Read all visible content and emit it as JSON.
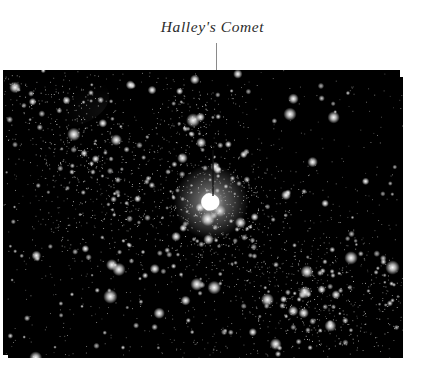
{
  "page": {
    "background_color": "#ffffff",
    "width": 421,
    "height": 375
  },
  "caption": {
    "text": "Halley's Comet",
    "color": "#2b2b2b",
    "style": "italic-serif"
  },
  "leader_line": {
    "color": "#8a8a8a",
    "x": 216,
    "from_y": 43,
    "to_y": 72
  },
  "photo": {
    "name": "halleys-comet-starfield-photograph",
    "x": 3,
    "y": 70,
    "width": 400,
    "height": 288,
    "background_color": "#000000",
    "star_color": "#ffffff",
    "description": "Dense black-and-white astronomical photograph of a star field with Halley's Comet as a bright fan-shaped smudge near the centre",
    "pointer_in_image": {
      "color": "#101010",
      "x": 213,
      "from_y": 150,
      "to_y": 196
    },
    "comet": {
      "label": "comet-nucleus",
      "cx": 211,
      "cy": 202,
      "rx": 11,
      "ry": 9,
      "brightness": 1.0
    },
    "bright_regions": [
      {
        "name": "upper-centre-cluster",
        "cx": 196,
        "cy": 122,
        "rx": 26,
        "ry": 24,
        "intensity": 0.85
      },
      {
        "name": "comet-coma-halo",
        "cx": 214,
        "cy": 200,
        "rx": 44,
        "ry": 34,
        "intensity": 0.95
      },
      {
        "name": "left-mid-cloud",
        "cx": 112,
        "cy": 200,
        "rx": 52,
        "ry": 42,
        "intensity": 0.62
      },
      {
        "name": "left-upper-haze",
        "cx": 78,
        "cy": 148,
        "rx": 36,
        "ry": 30,
        "intensity": 0.42
      },
      {
        "name": "lower-right-cloud",
        "cx": 325,
        "cy": 305,
        "rx": 58,
        "ry": 40,
        "intensity": 0.8
      },
      {
        "name": "centre-lower-haze",
        "cx": 236,
        "cy": 236,
        "rx": 34,
        "ry": 26,
        "intensity": 0.5
      },
      {
        "name": "top-left-haze",
        "cx": 54,
        "cy": 96,
        "rx": 44,
        "ry": 26,
        "intensity": 0.38
      },
      {
        "name": "right-lower-haze",
        "cx": 288,
        "cy": 268,
        "rx": 30,
        "ry": 24,
        "intensity": 0.45
      }
    ],
    "star_counts": {
      "fine": 5200,
      "medium": 620,
      "bright": 110
    }
  }
}
